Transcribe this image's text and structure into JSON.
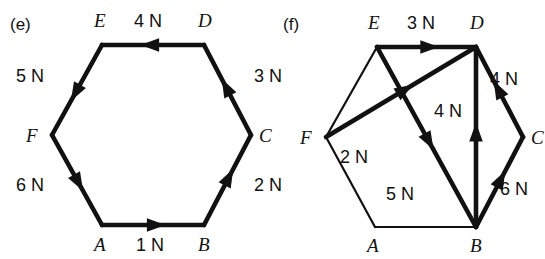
{
  "figure": {
    "background_color": "#ffffff",
    "ink_color": "#111111",
    "unit": "N"
  },
  "panels": [
    {
      "id": "e",
      "label": "(e)",
      "label_pos": {
        "x": 10,
        "y": 30
      },
      "shape": "regular-hexagon",
      "vertices": [
        {
          "name": "A",
          "x": 102,
          "y": 225,
          "label_x": 94,
          "label_y": 251
        },
        {
          "name": "B",
          "x": 204,
          "y": 225,
          "label_x": 198,
          "label_y": 251
        },
        {
          "name": "C",
          "x": 251,
          "y": 135,
          "label_x": 259,
          "label_y": 142
        },
        {
          "name": "D",
          "x": 204,
          "y": 45,
          "label_x": 198,
          "label_y": 27
        },
        {
          "name": "E",
          "x": 102,
          "y": 45,
          "label_x": 94,
          "label_y": 27
        },
        {
          "name": "F",
          "x": 52,
          "y": 135,
          "label_x": 26,
          "label_y": 142
        }
      ],
      "forces": [
        {
          "id": "e-AB",
          "from": "A",
          "to": "B",
          "magnitude": 1,
          "label": "1 N",
          "label_x": 136,
          "label_y": 251
        },
        {
          "id": "e-BC",
          "from": "B",
          "to": "C",
          "magnitude": 2,
          "label": "2 N",
          "label_x": 254,
          "label_y": 191
        },
        {
          "id": "e-CD",
          "from": "C",
          "to": "D",
          "magnitude": 3,
          "label": "3 N",
          "label_x": 254,
          "label_y": 82
        },
        {
          "id": "e-DE",
          "from": "D",
          "to": "E",
          "magnitude": 4,
          "label": "4 N",
          "label_x": 134,
          "label_y": 27
        },
        {
          "id": "e-EF",
          "from": "E",
          "to": "F",
          "magnitude": 5,
          "label": "5 N",
          "label_x": 16,
          "label_y": 82
        },
        {
          "id": "e-FA",
          "from": "F",
          "to": "A",
          "magnitude": 6,
          "label": "6 N",
          "label_x": 16,
          "label_y": 191
        }
      ],
      "plain_edges": []
    },
    {
      "id": "f",
      "label": "(f)",
      "label_pos": {
        "x": 283,
        "y": 30
      },
      "shape": "regular-hexagon",
      "vertices": [
        {
          "name": "A",
          "x": 375,
          "y": 227,
          "label_x": 367,
          "label_y": 252
        },
        {
          "name": "B",
          "x": 476,
          "y": 227,
          "label_x": 470,
          "label_y": 252
        },
        {
          "name": "C",
          "x": 523,
          "y": 137,
          "label_x": 531,
          "label_y": 144
        },
        {
          "name": "D",
          "x": 476,
          "y": 47,
          "label_x": 470,
          "label_y": 29
        },
        {
          "name": "E",
          "x": 377,
          "y": 47,
          "label_x": 368,
          "label_y": 29
        },
        {
          "name": "F",
          "x": 326,
          "y": 137,
          "label_x": 300,
          "label_y": 144
        }
      ],
      "forces": [
        {
          "id": "f-ED",
          "from": "E",
          "to": "D",
          "magnitude": 3,
          "label": "3 N",
          "label_x": 407,
          "label_y": 29
        },
        {
          "id": "f-DC",
          "from": "C",
          "to": "D",
          "magnitude": 4,
          "label": "4 N",
          "label_x": 490,
          "label_y": 85
        },
        {
          "id": "f-BC",
          "from": "B",
          "to": "C",
          "magnitude": 6,
          "label": "6 N",
          "label_x": 500,
          "label_y": 195
        },
        {
          "id": "f-BD",
          "from": "B",
          "to": "D",
          "magnitude": 4,
          "label": "4 N",
          "label_x": 434,
          "label_y": 117
        },
        {
          "id": "f-FD",
          "from": "F",
          "to": "D",
          "magnitude": 2,
          "label": "2 N",
          "label_x": 340,
          "label_y": 163
        },
        {
          "id": "f-EB",
          "from": "E",
          "to": "B",
          "magnitude": 5,
          "label": "5 N",
          "label_x": 386,
          "label_y": 200
        }
      ],
      "plain_edges": [
        {
          "id": "f-EF",
          "from": "E",
          "to": "F"
        },
        {
          "id": "f-FA",
          "from": "F",
          "to": "A"
        },
        {
          "id": "f-AB",
          "from": "A",
          "to": "B"
        }
      ]
    }
  ]
}
